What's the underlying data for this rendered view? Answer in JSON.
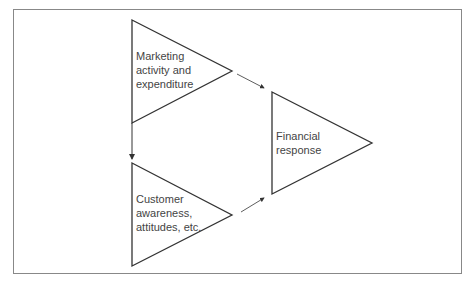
{
  "diagram": {
    "nodes": [
      {
        "id": "marketing",
        "label_lines": [
          "Marketing",
          "activity and",
          "expenditure"
        ]
      },
      {
        "id": "customer",
        "label_lines": [
          "Customer",
          "awareness,",
          "attitudes, etc."
        ]
      },
      {
        "id": "financial",
        "label_lines": [
          "Financial",
          "response"
        ]
      }
    ],
    "edges": [
      {
        "from": "marketing",
        "to": "customer"
      },
      {
        "from": "marketing",
        "to": "financial"
      },
      {
        "from": "customer",
        "to": "financial"
      }
    ]
  }
}
